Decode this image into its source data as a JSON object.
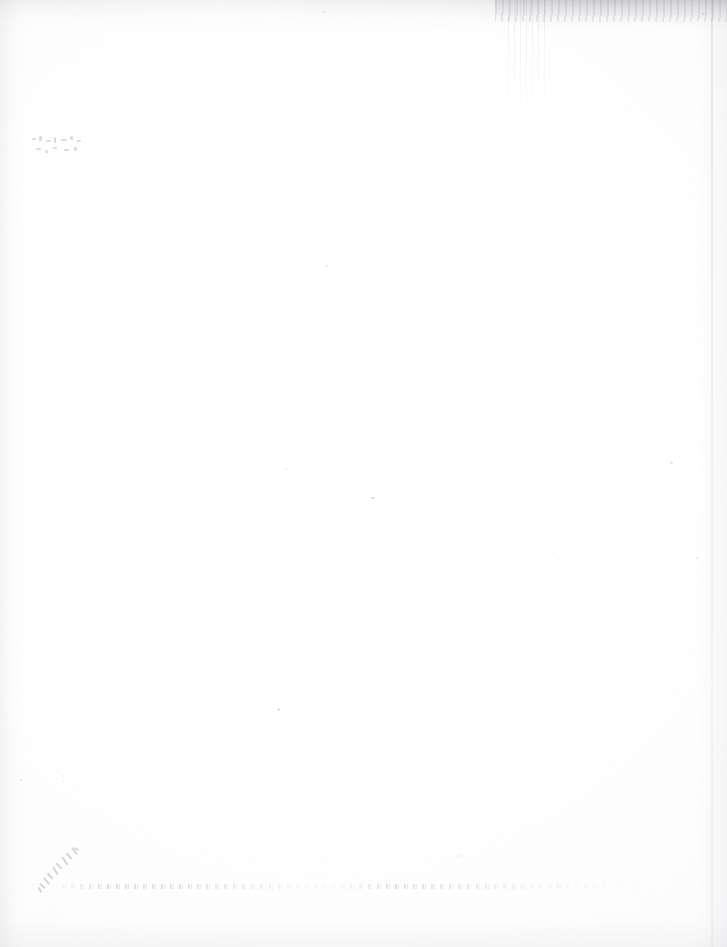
{
  "document": {
    "kind": "scanned-page",
    "surface": "blank verso of a scanned sheet",
    "visible_text": "",
    "page_width": 727,
    "page_height": 947,
    "background_color": "#ffffff",
    "artifact_ink_color": "#8f8f99"
  },
  "artifacts": {
    "top_edge_band": {
      "name": "top edge scan shadow",
      "description": "grey horizontal band along the top edge, darkening toward the right",
      "color": "#96969b"
    },
    "top_right_mottle": {
      "name": "top right mottled grey",
      "description": "mottled grey speckling in the upper right corner",
      "color": "#82828a"
    },
    "vertical_streaks": {
      "name": "scanner streaks",
      "description": "faint vertical scanner streaks below the top edge near the centre-right",
      "color": "#8c8c94"
    },
    "left_margin_band": {
      "name": "left margin gradient",
      "description": "soft vertical grey wash along the left edge",
      "color": "#aaaab2"
    },
    "right_boundary_line": {
      "name": "right page boundary",
      "description": "thin vertical scan boundary line near the right edge",
      "color": "#a0a0a8"
    },
    "bottom_edge_wash": {
      "name": "bottom edge wash",
      "description": "very faint grey wash along the bottom edge",
      "color": "#b9b9c0"
    },
    "ghost_marks_left": {
      "name": "bleed-through ghost marks",
      "description": "illegible ghost characters bleeding through from the reverse side, mid-left",
      "legible": false
    },
    "ghost_script_bottom_left": {
      "name": "diagonal handwriting ghost",
      "description": "faint diagonal handwritten scrawl showing through at the lower left",
      "legible": false
    },
    "ghost_line_bottom": {
      "name": "show-through text line",
      "description": "broken speckled horizontal line of show-through text running across the lower page",
      "legible": false
    },
    "dust_specks": {
      "name": "dust specks",
      "description": "scattered dark dust specks across the page",
      "count": 14
    }
  },
  "specks": [
    {
      "x": 323,
      "y": 11,
      "w": 2,
      "h": 2,
      "o": 0.3
    },
    {
      "x": 702,
      "y": 13,
      "w": 3,
      "h": 2,
      "o": 0.26
    },
    {
      "x": 233,
      "y": 148,
      "w": 2,
      "h": 1,
      "o": 0.18
    },
    {
      "x": 447,
      "y": 142,
      "w": 2,
      "h": 1,
      "o": 0.16
    },
    {
      "x": 326,
      "y": 265,
      "w": 2,
      "h": 2,
      "o": 0.22
    },
    {
      "x": 285,
      "y": 468,
      "w": 2,
      "h": 2,
      "o": 0.2
    },
    {
      "x": 371,
      "y": 497,
      "w": 4,
      "h": 2,
      "o": 0.36
    },
    {
      "x": 670,
      "y": 462,
      "w": 3,
      "h": 2,
      "o": 0.3
    },
    {
      "x": 696,
      "y": 557,
      "w": 2,
      "h": 2,
      "o": 0.22
    },
    {
      "x": 552,
      "y": 552,
      "w": 2,
      "h": 1,
      "o": 0.16
    },
    {
      "x": 277,
      "y": 708,
      "w": 3,
      "h": 3,
      "o": 0.32
    },
    {
      "x": 20,
      "y": 779,
      "w": 2,
      "h": 2,
      "o": 0.22
    },
    {
      "x": 62,
      "y": 775,
      "w": 2,
      "h": 2,
      "o": 0.18
    },
    {
      "x": 458,
      "y": 855,
      "w": 2,
      "h": 2,
      "o": 0.24
    }
  ]
}
